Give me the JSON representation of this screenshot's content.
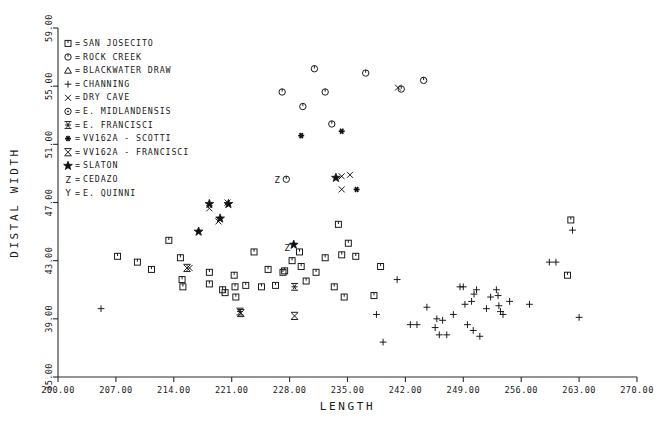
{
  "chart_data": {
    "type": "scatter",
    "title": "",
    "xlabel": "LENGTH",
    "ylabel": "DISTAL WIDTH",
    "xlim": [
      200.0,
      270.0
    ],
    "ylim": [
      35.0,
      59.0
    ],
    "xticks": [
      "200.00",
      "207.00",
      "214.00",
      "221.00",
      "228.00",
      "235.00",
      "242.00",
      "249.00",
      "256.00",
      "263.00",
      "270.00"
    ],
    "yticks": [
      "35.00",
      "39.00",
      "43.00",
      "47.00",
      "51.00",
      "55.00",
      "59.00"
    ],
    "grid": false,
    "legend_position": "upper-left-inside",
    "series": [
      {
        "name": "SAN JOSECITO",
        "symbol": "square-tick",
        "points": [
          [
            207.2,
            43.3
          ],
          [
            209.6,
            42.9
          ],
          [
            211.3,
            42.4
          ],
          [
            213.4,
            44.4
          ],
          [
            214.8,
            43.2
          ],
          [
            215.0,
            41.7
          ],
          [
            215.1,
            41.2
          ],
          [
            218.3,
            42.2
          ],
          [
            218.3,
            41.4
          ],
          [
            219.9,
            41.0
          ],
          [
            220.2,
            40.8
          ],
          [
            221.3,
            42.0
          ],
          [
            221.4,
            41.2
          ],
          [
            221.5,
            40.5
          ],
          [
            222.7,
            41.3
          ],
          [
            223.7,
            43.6
          ],
          [
            224.6,
            41.2
          ],
          [
            225.4,
            42.4
          ],
          [
            226.3,
            41.3
          ],
          [
            227.2,
            42.2
          ],
          [
            227.4,
            42.3
          ],
          [
            228.3,
            43.0
          ],
          [
            229.2,
            43.6
          ],
          [
            229.4,
            42.6
          ],
          [
            230.0,
            41.6
          ],
          [
            231.2,
            42.2
          ],
          [
            232.3,
            43.2
          ],
          [
            233.4,
            41.2
          ],
          [
            233.9,
            45.5
          ],
          [
            234.3,
            43.4
          ],
          [
            234.6,
            40.5
          ],
          [
            235.1,
            44.2
          ],
          [
            236.0,
            43.3
          ],
          [
            238.2,
            40.6
          ],
          [
            239.0,
            42.6
          ],
          [
            261.6,
            42.0
          ],
          [
            262.0,
            45.8
          ]
        ]
      },
      {
        "name": "ROCK CREEK",
        "symbol": "circle-tick",
        "points": [
          [
            227.1,
            54.6
          ],
          [
            229.6,
            53.6
          ],
          [
            231.0,
            56.2
          ],
          [
            232.3,
            54.6
          ],
          [
            233.1,
            52.4
          ],
          [
            237.2,
            55.9
          ],
          [
            241.5,
            54.8
          ],
          [
            244.2,
            55.4
          ],
          [
            227.6,
            48.6
          ]
        ]
      },
      {
        "name": "BLACKWATER DRAW",
        "symbol": "triangle",
        "points": []
      },
      {
        "name": "CHANNING",
        "symbol": "plus",
        "points": [
          [
            205.2,
            39.7
          ],
          [
            238.5,
            39.3
          ],
          [
            239.3,
            37.4
          ],
          [
            241.0,
            41.7
          ],
          [
            242.6,
            38.6
          ],
          [
            243.4,
            38.6
          ],
          [
            244.6,
            39.8
          ],
          [
            245.6,
            38.4
          ],
          [
            245.8,
            39.0
          ],
          [
            246.1,
            37.9
          ],
          [
            246.5,
            38.9
          ],
          [
            247.0,
            37.9
          ],
          [
            247.8,
            39.3
          ],
          [
            248.6,
            41.2
          ],
          [
            249.0,
            41.2
          ],
          [
            249.2,
            40.0
          ],
          [
            249.5,
            38.6
          ],
          [
            250.0,
            40.2
          ],
          [
            250.2,
            38.2
          ],
          [
            250.3,
            40.7
          ],
          [
            250.6,
            41.0
          ],
          [
            251.0,
            37.8
          ],
          [
            251.8,
            39.7
          ],
          [
            252.3,
            40.5
          ],
          [
            253.0,
            41.0
          ],
          [
            253.2,
            40.6
          ],
          [
            253.3,
            39.9
          ],
          [
            253.5,
            39.5
          ],
          [
            253.8,
            39.3
          ],
          [
            254.6,
            40.2
          ],
          [
            257.0,
            40.0
          ],
          [
            259.4,
            42.9
          ],
          [
            260.2,
            42.9
          ],
          [
            263.0,
            39.1
          ],
          [
            262.2,
            45.1
          ]
        ]
      },
      {
        "name": "DRY CAVE",
        "symbol": "x",
        "points": [
          [
            218.3,
            46.6
          ],
          [
            219.4,
            45.7
          ],
          [
            220.5,
            47.0
          ],
          [
            234.3,
            48.8
          ],
          [
            235.3,
            48.9
          ],
          [
            234.3,
            47.9
          ],
          [
            241.1,
            54.9
          ],
          [
            215.9,
            42.5
          ]
        ]
      },
      {
        "name": "E. MIDLANDENSIS",
        "symbol": "circle-dot",
        "points": []
      },
      {
        "name": "E. FRANCISCI",
        "symbol": "asterisk-thin",
        "points": [
          [
            222.0,
            39.5
          ],
          [
            228.6,
            41.2
          ]
        ]
      },
      {
        "name": "VV162A - SCOTTI",
        "symbol": "asterisk-bold",
        "points": [
          [
            229.4,
            51.6
          ],
          [
            234.3,
            51.9
          ],
          [
            236.1,
            47.9
          ]
        ]
      },
      {
        "name": "VV162A - FRANCISCI",
        "symbol": "x-bar",
        "points": [
          [
            215.6,
            42.5
          ],
          [
            222.1,
            39.4
          ],
          [
            228.6,
            39.2
          ]
        ]
      },
      {
        "name": "SLATON",
        "symbol": "star",
        "points": [
          [
            218.3,
            46.9
          ],
          [
            220.6,
            46.9
          ],
          [
            219.6,
            45.9
          ],
          [
            217.0,
            45.0
          ],
          [
            233.6,
            48.7
          ],
          [
            228.5,
            44.1
          ]
        ]
      },
      {
        "name": "CEDAZO",
        "symbol": "letter-Z",
        "points": [
          [
            226.5,
            48.6
          ],
          [
            227.7,
            43.9
          ]
        ]
      },
      {
        "name": "E. QUINNI",
        "symbol": "letter-Y",
        "points": []
      }
    ]
  },
  "legend": {
    "items": [
      {
        "symbol": "square-tick",
        "eq": "=",
        "label": "SAN JOSECITO"
      },
      {
        "symbol": "circle-tick",
        "eq": "=",
        "label": "ROCK CREEK"
      },
      {
        "symbol": "triangle",
        "eq": "=",
        "label": "BLACKWATER DRAW"
      },
      {
        "symbol": "plus",
        "eq": "=",
        "label": "CHANNING"
      },
      {
        "symbol": "x",
        "eq": "=",
        "label": "DRY CAVE"
      },
      {
        "symbol": "circle-dot",
        "eq": "=",
        "label": "E. MIDLANDENSIS"
      },
      {
        "symbol": "asterisk-thin",
        "eq": "=",
        "label": "E. FRANCISCI"
      },
      {
        "symbol": "asterisk-bold",
        "eq": "=",
        "label": "VV162A - SCOTTI"
      },
      {
        "symbol": "x-bar",
        "eq": "=",
        "label": "VV162A - FRANCISCI"
      },
      {
        "symbol": "star",
        "eq": "=",
        "label": "SLATON"
      },
      {
        "symbol": "letter-Z",
        "eq": "=",
        "label": "CEDAZO"
      },
      {
        "symbol": "letter-Y",
        "eq": "=",
        "label": "E. QUINNI"
      }
    ]
  },
  "colors": {
    "ink": "#1a1a1a",
    "background": "#ffffff"
  }
}
